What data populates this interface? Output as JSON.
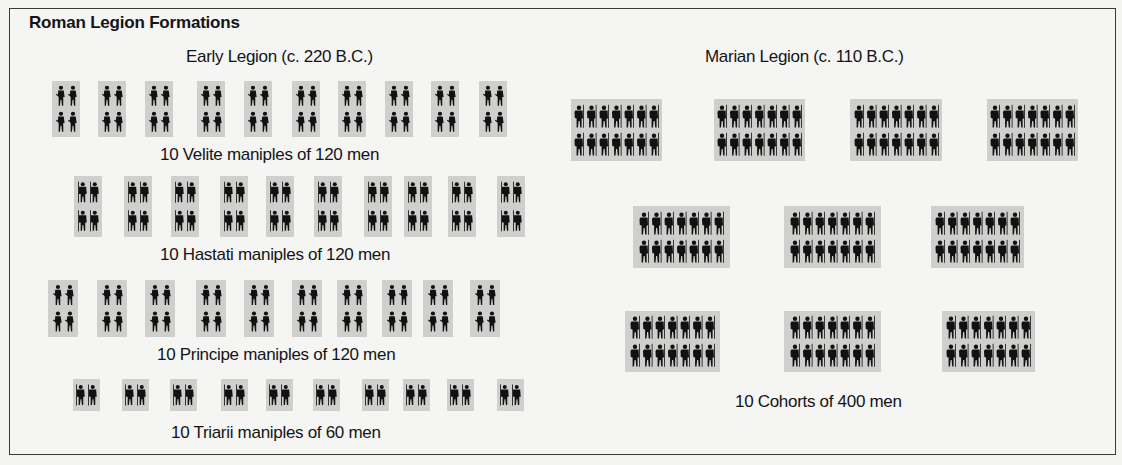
{
  "title": "Roman Legion Formations",
  "colors": {
    "background": "#f3f3f2",
    "block": "#cfcfcd",
    "figure": "#111111",
    "border": "#3a3a3a"
  },
  "early_legion": {
    "heading": "Early Legion (c. 220 B.C.)",
    "lines": [
      {
        "name": "velites",
        "caption": "10 Velite maniples of 120 men",
        "count": 10,
        "figure_cols": 2,
        "figure_rows": 2,
        "figure_icon": "soldier-icon",
        "block_x": [
          52,
          98,
          145,
          197,
          244,
          292,
          338,
          385,
          431,
          479
        ],
        "block_y": 81,
        "block_w": 28,
        "block_h": 56,
        "caption_x": 160,
        "caption_y": 145
      },
      {
        "name": "hastati",
        "caption": "10 Hastati maniples of 120 men",
        "count": 10,
        "figure_cols": 2,
        "figure_rows": 2,
        "figure_icon": "spearman-icon",
        "block_x": [
          74,
          124,
          171,
          220,
          266,
          314,
          364,
          404,
          448,
          497
        ],
        "block_y": 176,
        "block_w": 28,
        "block_h": 61,
        "caption_x": 160,
        "caption_y": 245
      },
      {
        "name": "principes",
        "caption": "10 Principe maniples of 120 men",
        "count": 10,
        "figure_cols": 2,
        "figure_rows": 2,
        "figure_icon": "soldier-icon",
        "block_x": [
          48,
          97,
          145,
          196,
          244,
          292,
          337,
          382,
          423,
          470
        ],
        "block_y": 280,
        "block_w": 30,
        "block_h": 57,
        "caption_x": 157,
        "caption_y": 345
      },
      {
        "name": "triarii",
        "caption": "10 Triarii maniples of 60 men",
        "count": 10,
        "figure_cols": 2,
        "figure_rows": 1,
        "figure_icon": "spearman-icon",
        "block_x": [
          73,
          122,
          170,
          221,
          266,
          313,
          362,
          403,
          447,
          497
        ],
        "block_y": 379,
        "block_w": 27,
        "block_h": 32,
        "caption_x": 171,
        "caption_y": 423
      }
    ]
  },
  "marian_legion": {
    "heading": "Marian Legion (c. 110 B.C.)",
    "caption": "10 Cohorts of 400 men",
    "caption_x": 735,
    "caption_y": 392,
    "figure_cols": 7,
    "figure_rows": 2,
    "figure_icon": "legionary-icon",
    "cohorts": [
      {
        "x": 571,
        "y": 99,
        "w": 91,
        "h": 62
      },
      {
        "x": 714,
        "y": 99,
        "w": 91,
        "h": 62
      },
      {
        "x": 850,
        "y": 99,
        "w": 92,
        "h": 62
      },
      {
        "x": 987,
        "y": 99,
        "w": 91,
        "h": 62
      },
      {
        "x": 633,
        "y": 206,
        "w": 97,
        "h": 62
      },
      {
        "x": 784,
        "y": 206,
        "w": 97,
        "h": 62
      },
      {
        "x": 931,
        "y": 206,
        "w": 93,
        "h": 62
      },
      {
        "x": 625,
        "y": 311,
        "w": 95,
        "h": 61
      },
      {
        "x": 784,
        "y": 311,
        "w": 97,
        "h": 61
      },
      {
        "x": 942,
        "y": 311,
        "w": 93,
        "h": 61
      }
    ]
  }
}
